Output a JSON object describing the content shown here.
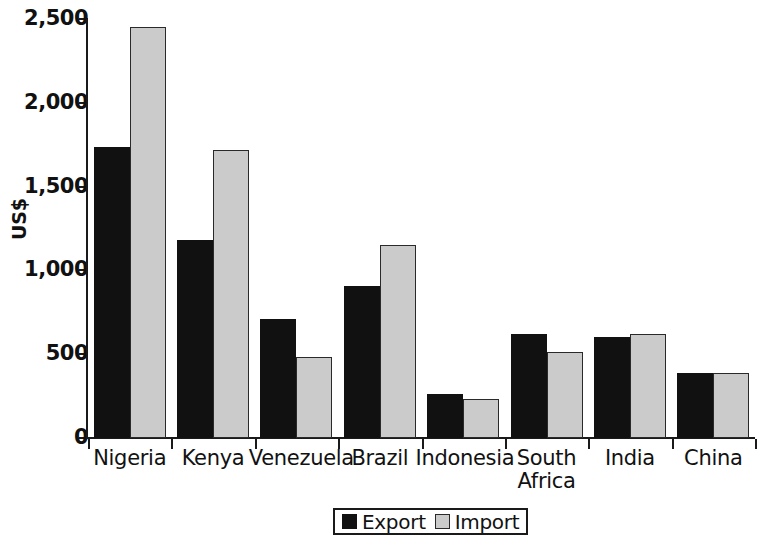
{
  "chart_data": {
    "type": "bar",
    "title": "",
    "subtitle": "",
    "xlabel": "",
    "ylabel": "US$",
    "ylim": [
      0,
      2500
    ],
    "yticks": [
      "0",
      "500",
      "1,000",
      "1,500",
      "2,000",
      "2,500"
    ],
    "ytick_values": [
      0,
      500,
      1000,
      1500,
      2000,
      2500
    ],
    "grid": false,
    "legend_position": "bottom-center",
    "categories": [
      "Nigeria",
      "Kenya",
      "Venezuela",
      "Brazil",
      "Indonesia",
      "South\nAfrica",
      "India",
      "China"
    ],
    "series": [
      {
        "name": "Export",
        "color": "#111111",
        "values": [
          1735,
          1180,
          710,
          905,
          265,
          620,
          605,
          385
        ]
      },
      {
        "name": "Import",
        "color": "#cbcbcb",
        "values": [
          2450,
          1720,
          485,
          1150,
          235,
          515,
          620,
          390
        ]
      }
    ]
  },
  "legend": {
    "items": [
      {
        "label": "Export",
        "swatch": "export"
      },
      {
        "label": "Import",
        "swatch": "import"
      }
    ]
  }
}
